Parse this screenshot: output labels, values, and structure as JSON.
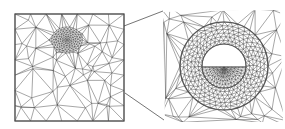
{
  "figure": {
    "colors": {
      "line": "#3a3a3a",
      "frame": "#555555",
      "background": "#ffffff",
      "empty_region": "#ffffff"
    },
    "left_panel": {
      "name": "coarse-mesh-domain",
      "frame": {
        "x": 15,
        "y": 14,
        "w": 109,
        "h": 107
      },
      "refinement_center": {
        "x": 67,
        "y": 40
      }
    },
    "connectors": [
      {
        "x1": 124,
        "y1": 26,
        "x2": 163,
        "y2": 11
      },
      {
        "x1": 125,
        "y1": 93,
        "x2": 164,
        "y2": 120
      }
    ],
    "right_panel": {
      "name": "zoomed-inclusion",
      "region": {
        "x": 163,
        "y": 10,
        "w": 120,
        "h": 112
      },
      "center": {
        "x": 224,
        "y": 66
      },
      "outer_radius": 44,
      "inner_radius": 22,
      "chord_y": 67
    }
  }
}
